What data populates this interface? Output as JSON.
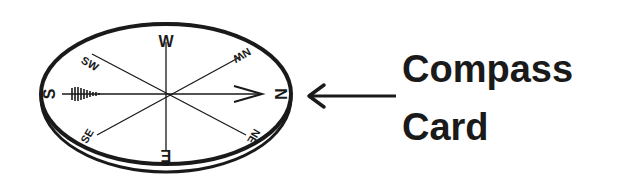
{
  "label": {
    "line1": "Compass",
    "line2": "Card"
  },
  "compass": {
    "points": {
      "north": "N",
      "south": "S",
      "east": "E",
      "west": "W",
      "northeast": "NE",
      "northwest": "NW",
      "southeast": "SE",
      "southwest": "SW"
    }
  },
  "colors": {
    "ink": "#1a1a1a",
    "background": "#ffffff"
  }
}
